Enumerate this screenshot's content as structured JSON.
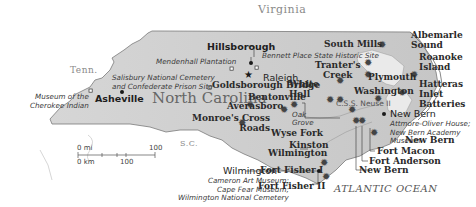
{
  "map": {
    "title": "North Carolina",
    "colors": {
      "land": "#d4d4d4",
      "border": "#6e6e6e",
      "water": "#ffffff",
      "marker": "#1a1a1a"
    },
    "regions": {
      "virginia": "Virginia",
      "tennessee": "Tenn.",
      "south_carolina": "S.C.",
      "ocean": "ATLANTIC OCEAN"
    },
    "cities": {
      "hillsborough": "Hillsborough",
      "raleigh": "Raleigh",
      "asheville": "Asheville",
      "wilmington": "Wilmington",
      "new_bern": "New Bern"
    },
    "battles": {
      "south_mills": "South Mills",
      "albemarle": "Albemarle\nSound",
      "roanoke": "Roanoke\nIsland",
      "tranters_creek": "Tranter's\nCreek",
      "plymouth": "Plymouth",
      "white_hall": "White\nHall",
      "washington": "Washington",
      "hatteras": "Hatteras\nInlet\nBatteries",
      "goldsborough": "Goldsborough Bridge",
      "bentonville": "Bentonville",
      "averasboro": "Averasboro",
      "monroes": "Monroe's Cross\nRoads",
      "wyse_fork": "Wyse Fork",
      "kinston": "Kinston",
      "wilmington_battle": "Wilmington",
      "new_bern_battle": "New Bern",
      "fort_macon": "Fort Macon",
      "fort_anderson": "Fort Anderson",
      "new_bern_2": "New Bern",
      "fort_fisher_1": "Fort Fisher I",
      "fort_fisher_2": "Fort Fisher II"
    },
    "sites": {
      "bennett": "Bennett Place State Historic Site",
      "mendenhall": "Mendenhall Plantation",
      "salisbury": "Salisbury National Cemetery\nand Confederate Prison Site",
      "cherokee": "Museum of the\nCherokee Indian",
      "oak_grove": "Oak\nGrove",
      "new_bern_sites": "Attmore-Oliver House;\nNew Bern Academy\nMuseum",
      "wilmington_sites": "Cameron Art Museum;\nCape Fear Museum;\nWilmington National Cemetery"
    },
    "ship": "C.S.S. Neuse II",
    "scale": {
      "mi_label": "0 mi",
      "mi_max": "100",
      "km_label": "0 km",
      "km_mid": "100"
    }
  }
}
